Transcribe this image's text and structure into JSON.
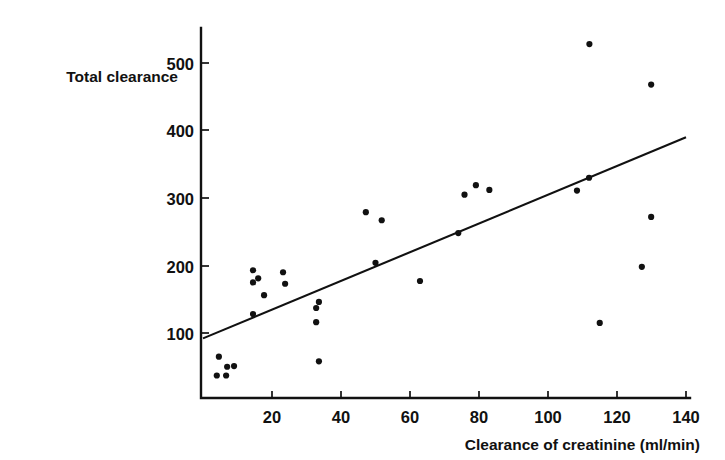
{
  "chart_data": {
    "type": "scatter",
    "title": "",
    "xlabel": "Clearance of creatinine (ml/min)",
    "ylabel": "Total clearance",
    "xlim": [
      0,
      143
    ],
    "ylim": [
      0,
      545
    ],
    "grid": false,
    "legend": "none",
    "xticks": [
      20,
      40,
      60,
      80,
      100,
      120,
      140
    ],
    "yticks": [
      100,
      200,
      300,
      400,
      500
    ],
    "xtick_labels": [
      "20",
      "40",
      "60",
      "80",
      "100",
      "120",
      "140"
    ],
    "ytick_labels": [
      "100",
      "200",
      "300",
      "400",
      "500"
    ],
    "points": [
      {
        "x": 4.6,
        "y": 65
      },
      {
        "x": 7.0,
        "y": 50
      },
      {
        "x": 9.0,
        "y": 51
      },
      {
        "x": 4.0,
        "y": 37
      },
      {
        "x": 6.7,
        "y": 37
      },
      {
        "x": 14.5,
        "y": 193
      },
      {
        "x": 16.0,
        "y": 181
      },
      {
        "x": 14.5,
        "y": 175
      },
      {
        "x": 23.2,
        "y": 190
      },
      {
        "x": 23.8,
        "y": 173
      },
      {
        "x": 17.7,
        "y": 156
      },
      {
        "x": 14.5,
        "y": 128
      },
      {
        "x": 33.6,
        "y": 146
      },
      {
        "x": 32.8,
        "y": 137
      },
      {
        "x": 32.8,
        "y": 116
      },
      {
        "x": 33.6,
        "y": 58
      },
      {
        "x": 47.2,
        "y": 279
      },
      {
        "x": 51.8,
        "y": 267
      },
      {
        "x": 50.0,
        "y": 204
      },
      {
        "x": 62.9,
        "y": 177
      },
      {
        "x": 74.0,
        "y": 248
      },
      {
        "x": 75.8,
        "y": 305
      },
      {
        "x": 79.1,
        "y": 319
      },
      {
        "x": 83.0,
        "y": 312
      },
      {
        "x": 108.4,
        "y": 311
      },
      {
        "x": 111.9,
        "y": 330
      },
      {
        "x": 112.0,
        "y": 528
      },
      {
        "x": 115.0,
        "y": 115
      },
      {
        "x": 129.9,
        "y": 468
      },
      {
        "x": 129.9,
        "y": 272
      },
      {
        "x": 127.2,
        "y": 198
      }
    ],
    "fit_line": {
      "x_start": 0,
      "y_start": 92,
      "x_end": 140,
      "y_end": 390
    }
  }
}
